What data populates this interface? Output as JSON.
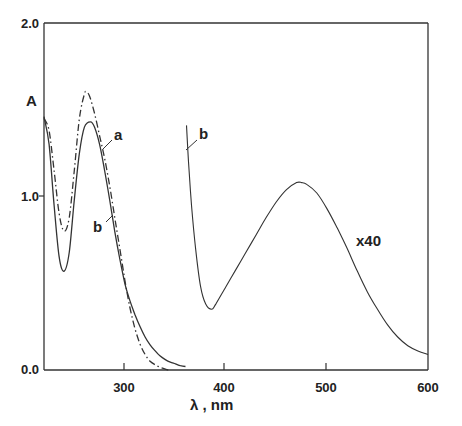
{
  "chart_data": {
    "type": "line",
    "title": "",
    "xlabel": "λ , nm",
    "ylabel": "A",
    "xlim": [
      220,
      600
    ],
    "ylim": [
      0.0,
      2.0
    ],
    "xticks": [
      300,
      400,
      500,
      600
    ],
    "xtick_labels": [
      "300",
      "400",
      "500",
      "600"
    ],
    "yticks": [
      0.0,
      1.0,
      2.0
    ],
    "ytick_labels": [
      "0.0",
      "1.0",
      "2.0"
    ],
    "grid": false,
    "legend": "none (curves labeled inline)",
    "series": [
      {
        "name": "a",
        "style": "dash-dot",
        "x": [
          220,
          225,
          230,
          235,
          240,
          245,
          250,
          255,
          260,
          262,
          265,
          270,
          275,
          280,
          285,
          290,
          295,
          300,
          305,
          310,
          315,
          320,
          325,
          330,
          335,
          340,
          343
        ],
        "y": [
          1.45,
          1.38,
          1.15,
          0.9,
          0.8,
          0.88,
          1.15,
          1.45,
          1.59,
          1.6,
          1.58,
          1.48,
          1.35,
          1.22,
          1.06,
          0.88,
          0.7,
          0.52,
          0.36,
          0.24,
          0.15,
          0.09,
          0.05,
          0.03,
          0.015,
          0.005,
          0.0
        ]
      },
      {
        "name": "b",
        "style": "solid",
        "x": [
          220,
          225,
          230,
          235,
          240,
          245,
          250,
          255,
          260,
          266,
          270,
          275,
          280,
          285,
          290,
          295,
          300,
          305,
          310,
          315,
          320,
          325,
          330,
          335,
          340,
          345,
          350,
          355,
          360
        ],
        "y": [
          1.46,
          1.3,
          0.95,
          0.65,
          0.57,
          0.68,
          0.98,
          1.25,
          1.4,
          1.43,
          1.4,
          1.3,
          1.15,
          0.98,
          0.8,
          0.64,
          0.5,
          0.4,
          0.32,
          0.25,
          0.19,
          0.145,
          0.11,
          0.08,
          0.06,
          0.045,
          0.035,
          0.025,
          0.02
        ]
      },
      {
        "name": "b x40",
        "style": "solid",
        "scale_factor": 40,
        "x": [
          361,
          363,
          366,
          370,
          375,
          380,
          386,
          390,
          400,
          410,
          420,
          430,
          440,
          450,
          460,
          470,
          475,
          480,
          490,
          500,
          510,
          520,
          530,
          540,
          550,
          560,
          570,
          580,
          590,
          600
        ],
        "y": [
          1.41,
          1.2,
          0.95,
          0.7,
          0.48,
          0.38,
          0.35,
          0.38,
          0.48,
          0.58,
          0.68,
          0.78,
          0.88,
          0.97,
          1.04,
          1.08,
          1.08,
          1.07,
          1.02,
          0.93,
          0.82,
          0.7,
          0.57,
          0.45,
          0.35,
          0.26,
          0.19,
          0.14,
          0.11,
          0.09
        ]
      }
    ],
    "annotations": [
      {
        "text": "a",
        "target": "series a",
        "x": 282,
        "y": 1.33
      },
      {
        "text": "b",
        "target": "series b",
        "x": 275,
        "y": 0.85
      },
      {
        "text": "b",
        "target": "series b x40",
        "x": 368,
        "y": 1.42
      },
      {
        "text": "x40",
        "target": "series b x40",
        "x": 535,
        "y": 0.75
      }
    ]
  },
  "labels": {
    "y_axis_title": "A",
    "x_axis_title": "λ , nm",
    "ytick_0": "0.0",
    "ytick_1": "1.0",
    "ytick_2": "2.0",
    "xtick_300": "300",
    "xtick_400": "400",
    "xtick_500": "500",
    "xtick_600": "600",
    "annot_a": "a",
    "annot_b": "b",
    "annot_b2": "b",
    "annot_x40": "x40"
  }
}
